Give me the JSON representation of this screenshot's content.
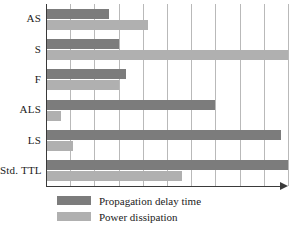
{
  "chart_data": {
    "type": "bar",
    "orientation": "horizontal",
    "title": "",
    "xlabel": "",
    "ylabel": "",
    "categories": [
      "AS",
      "S",
      "F",
      "ALS",
      "LS",
      "Std. TTL"
    ],
    "series": [
      {
        "name": "Propagation delay time",
        "color": "#7c7c7c",
        "values": [
          2.6,
          3.0,
          3.3,
          7.0,
          9.7,
          10.0
        ]
      },
      {
        "name": "Power dissipation",
        "color": "#b0b0b0",
        "values": [
          4.2,
          10.0,
          3.0,
          0.6,
          1.1,
          5.6
        ]
      }
    ],
    "xlim": [
      0,
      10
    ],
    "gridline_count": 10,
    "grid": true,
    "tick_labels": [],
    "legend_position": "bottom-left",
    "axis_arrow": true
  },
  "legend": {
    "items": [
      {
        "label": "Propagation delay time",
        "swatch": "delay"
      },
      {
        "label": "Power dissipation",
        "swatch": "power"
      }
    ]
  },
  "colors": {
    "bar_delay": "#7c7c7c",
    "bar_power": "#b0b0b0",
    "gridline": "#b9b9b9",
    "axis": "#3a3a3a",
    "text": "#1b1b1b",
    "background": "#ffffff"
  }
}
